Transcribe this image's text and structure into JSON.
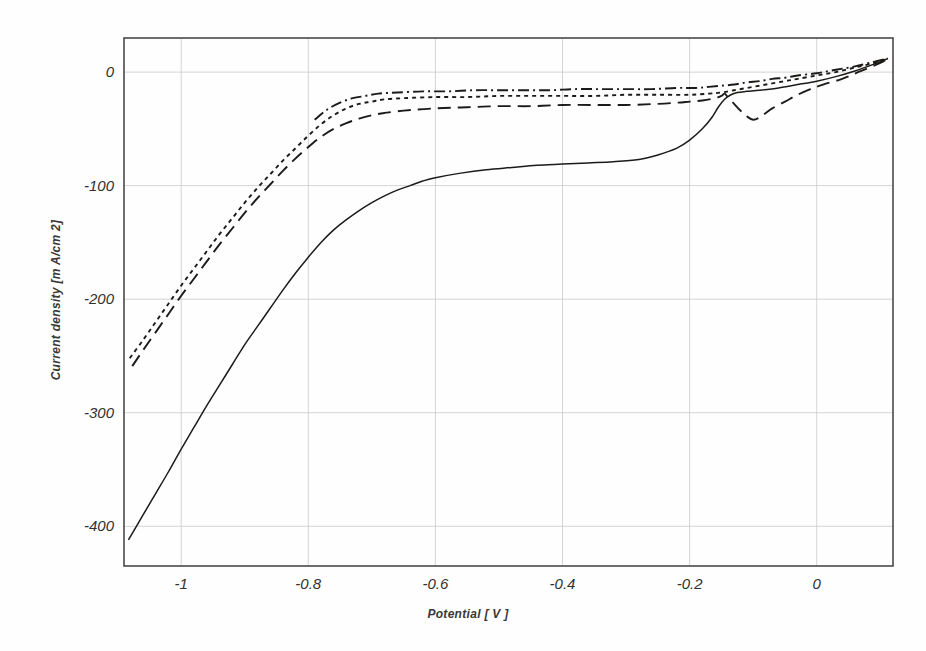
{
  "chart_data": {
    "type": "line",
    "title": "",
    "xlabel": "Potential [ V ]",
    "ylabel": "Current density [m A/cm 2]",
    "xlim": [
      -1.09,
      0.12
    ],
    "ylim": [
      -435,
      30
    ],
    "xticks": [
      "-1",
      "-0.8",
      "-0.6",
      "-0.4",
      "-0.2",
      "0"
    ],
    "xtick_values": [
      -1,
      -0.8,
      -0.6,
      -0.4,
      -0.2,
      0
    ],
    "yticks": [
      "0",
      "-100",
      "-200",
      "-300",
      "-400"
    ],
    "ytick_values": [
      0,
      -100,
      -200,
      -300,
      -400
    ],
    "grid": true,
    "legend": "none",
    "series": [
      {
        "name": "curve-solid",
        "style": "solid",
        "points": [
          [
            -1.083,
            -412
          ],
          [
            -1.06,
            -390
          ],
          [
            -1.04,
            -371
          ],
          [
            -1.02,
            -352
          ],
          [
            -1.0,
            -332
          ],
          [
            -0.98,
            -313
          ],
          [
            -0.96,
            -294
          ],
          [
            -0.94,
            -276
          ],
          [
            -0.92,
            -258
          ],
          [
            -0.9,
            -240
          ],
          [
            -0.88,
            -224
          ],
          [
            -0.86,
            -208
          ],
          [
            -0.84,
            -192
          ],
          [
            -0.82,
            -177
          ],
          [
            -0.8,
            -163
          ],
          [
            -0.78,
            -150
          ],
          [
            -0.76,
            -139
          ],
          [
            -0.74,
            -130
          ],
          [
            -0.72,
            -122
          ],
          [
            -0.7,
            -115
          ],
          [
            -0.68,
            -109
          ],
          [
            -0.66,
            -104
          ],
          [
            -0.64,
            -100
          ],
          [
            -0.62,
            -96
          ],
          [
            -0.6,
            -93
          ],
          [
            -0.56,
            -89
          ],
          [
            -0.52,
            -86
          ],
          [
            -0.48,
            -84
          ],
          [
            -0.44,
            -82
          ],
          [
            -0.4,
            -81
          ],
          [
            -0.36,
            -80
          ],
          [
            -0.32,
            -79
          ],
          [
            -0.28,
            -77
          ],
          [
            -0.25,
            -73
          ],
          [
            -0.22,
            -67
          ],
          [
            -0.2,
            -60
          ],
          [
            -0.18,
            -50
          ],
          [
            -0.165,
            -40
          ],
          [
            -0.155,
            -31
          ],
          [
            -0.145,
            -24
          ],
          [
            -0.135,
            -20
          ],
          [
            -0.125,
            -18
          ],
          [
            -0.11,
            -17
          ],
          [
            -0.09,
            -16
          ],
          [
            -0.06,
            -14
          ],
          [
            -0.03,
            -11
          ],
          [
            0.0,
            -8
          ],
          [
            0.03,
            -4
          ],
          [
            0.06,
            1
          ],
          [
            0.09,
            7
          ],
          [
            0.112,
            12
          ]
        ]
      },
      {
        "name": "curve-longdash",
        "style": "long-dash",
        "points": [
          [
            -1.077,
            -259
          ],
          [
            -1.06,
            -245
          ],
          [
            -1.04,
            -229
          ],
          [
            -1.02,
            -213
          ],
          [
            -1.0,
            -197
          ],
          [
            -0.98,
            -182
          ],
          [
            -0.96,
            -167
          ],
          [
            -0.94,
            -152
          ],
          [
            -0.92,
            -138
          ],
          [
            -0.9,
            -124
          ],
          [
            -0.88,
            -111
          ],
          [
            -0.86,
            -99
          ],
          [
            -0.84,
            -87
          ],
          [
            -0.82,
            -76
          ],
          [
            -0.8,
            -66
          ],
          [
            -0.78,
            -57
          ],
          [
            -0.76,
            -50
          ],
          [
            -0.74,
            -45
          ],
          [
            -0.72,
            -41
          ],
          [
            -0.7,
            -38
          ],
          [
            -0.68,
            -36
          ],
          [
            -0.65,
            -34
          ],
          [
            -0.6,
            -32
          ],
          [
            -0.55,
            -31
          ],
          [
            -0.5,
            -30
          ],
          [
            -0.45,
            -30
          ],
          [
            -0.4,
            -29
          ],
          [
            -0.35,
            -29
          ],
          [
            -0.3,
            -29
          ],
          [
            -0.25,
            -28
          ],
          [
            -0.22,
            -27
          ],
          [
            -0.2,
            -26
          ],
          [
            -0.18,
            -25
          ],
          [
            -0.16,
            -23
          ],
          [
            -0.15,
            -21
          ],
          [
            -0.145,
            -19
          ],
          [
            -0.14,
            -22
          ],
          [
            -0.13,
            -28
          ],
          [
            -0.12,
            -34
          ],
          [
            -0.11,
            -39
          ],
          [
            -0.1,
            -42
          ],
          [
            -0.09,
            -40
          ],
          [
            -0.08,
            -36
          ],
          [
            -0.07,
            -32
          ],
          [
            -0.05,
            -26
          ],
          [
            -0.03,
            -20
          ],
          [
            -0.01,
            -15
          ],
          [
            0.01,
            -11
          ],
          [
            0.04,
            -6
          ],
          [
            0.07,
            1
          ],
          [
            0.1,
            8
          ],
          [
            0.112,
            12
          ]
        ]
      },
      {
        "name": "curve-dotted",
        "style": "dotted",
        "points": [
          [
            -1.081,
            -252
          ],
          [
            -1.06,
            -236
          ],
          [
            -1.04,
            -220
          ],
          [
            -1.02,
            -204
          ],
          [
            -1.0,
            -188
          ],
          [
            -0.98,
            -173
          ],
          [
            -0.96,
            -158
          ],
          [
            -0.94,
            -143
          ],
          [
            -0.92,
            -129
          ],
          [
            -0.9,
            -115
          ],
          [
            -0.88,
            -102
          ],
          [
            -0.86,
            -90
          ],
          [
            -0.84,
            -78
          ],
          [
            -0.82,
            -67
          ],
          [
            -0.8,
            -56
          ],
          [
            -0.78,
            -46
          ],
          [
            -0.76,
            -38
          ],
          [
            -0.74,
            -32
          ],
          [
            -0.72,
            -28
          ],
          [
            -0.7,
            -26
          ],
          [
            -0.68,
            -24
          ],
          [
            -0.65,
            -23
          ],
          [
            -0.6,
            -22
          ],
          [
            -0.55,
            -22
          ],
          [
            -0.5,
            -21
          ],
          [
            -0.45,
            -21
          ],
          [
            -0.4,
            -21
          ],
          [
            -0.35,
            -21
          ],
          [
            -0.3,
            -20
          ],
          [
            -0.25,
            -20
          ],
          [
            -0.2,
            -20
          ],
          [
            -0.17,
            -19
          ],
          [
            -0.15,
            -18
          ],
          [
            -0.13,
            -16
          ],
          [
            -0.11,
            -14
          ],
          [
            -0.09,
            -12
          ],
          [
            -0.07,
            -10
          ],
          [
            -0.05,
            -8
          ],
          [
            -0.03,
            -6
          ],
          [
            0.0,
            -3
          ],
          [
            0.03,
            0
          ],
          [
            0.06,
            4
          ],
          [
            0.09,
            8
          ],
          [
            0.112,
            12
          ]
        ]
      },
      {
        "name": "curve-dashdot",
        "style": "dash-dot",
        "points": [
          [
            -0.79,
            -42
          ],
          [
            -0.77,
            -33
          ],
          [
            -0.75,
            -27
          ],
          [
            -0.73,
            -23
          ],
          [
            -0.71,
            -21
          ],
          [
            -0.69,
            -19
          ],
          [
            -0.66,
            -18
          ],
          [
            -0.62,
            -17
          ],
          [
            -0.58,
            -17
          ],
          [
            -0.54,
            -16
          ],
          [
            -0.5,
            -16
          ],
          [
            -0.46,
            -16
          ],
          [
            -0.42,
            -16
          ],
          [
            -0.38,
            -15
          ],
          [
            -0.34,
            -15
          ],
          [
            -0.3,
            -15
          ],
          [
            -0.26,
            -15
          ],
          [
            -0.22,
            -14
          ],
          [
            -0.19,
            -14
          ],
          [
            -0.17,
            -13
          ],
          [
            -0.15,
            -12
          ],
          [
            -0.13,
            -11
          ],
          [
            -0.11,
            -9
          ],
          [
            -0.09,
            -8
          ],
          [
            -0.07,
            -6
          ],
          [
            -0.05,
            -5
          ],
          [
            -0.03,
            -3
          ],
          [
            0.0,
            -1
          ],
          [
            0.03,
            2
          ],
          [
            0.06,
            5
          ],
          [
            0.09,
            9
          ],
          [
            0.112,
            12
          ]
        ]
      }
    ]
  }
}
